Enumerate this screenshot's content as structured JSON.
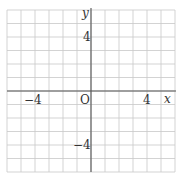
{
  "diagram": {
    "type": "coordinate-grid",
    "grid": {
      "cols": 12,
      "rows": 12,
      "x_range": [
        -6,
        6
      ],
      "y_range": [
        -6,
        6
      ],
      "grid_color": "#c8c8c8",
      "axis_color": "#555555"
    },
    "labels": {
      "x_axis": "x",
      "y_axis": "y",
      "origin": "O",
      "x_neg": "−4",
      "x_pos": "4",
      "y_pos": "4",
      "y_neg": "−4"
    }
  }
}
